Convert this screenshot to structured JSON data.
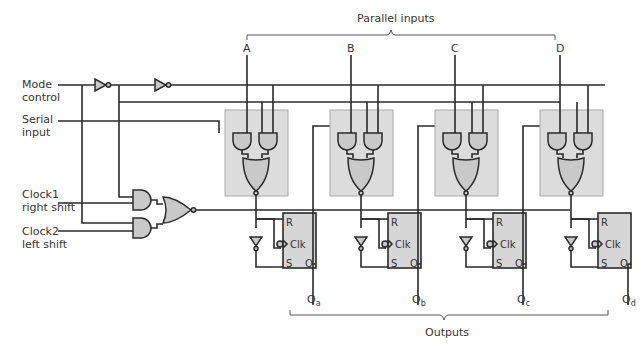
{
  "left_labels": {
    "mode_control": "Mode\ncontrol",
    "serial_input": "Serial\ninput",
    "clock1": "Clock1\nright shift",
    "clock2": "Clock2\nleft shift"
  },
  "parallel_inputs": {
    "label": "Parallel inputs",
    "inputs": [
      "A",
      "B",
      "C",
      "D"
    ]
  },
  "outputs": {
    "label": "Outputs",
    "items": [
      {
        "main": "Q",
        "sub": "a"
      },
      {
        "main": "Q",
        "sub": "b"
      },
      {
        "main": "Q",
        "sub": "c"
      },
      {
        "main": "Q",
        "sub": "d"
      }
    ]
  },
  "flipflop": {
    "r": "R",
    "clk": "Clk",
    "s": "S",
    "q": "Q"
  },
  "stages_x": [
    225,
    330,
    435,
    540
  ]
}
